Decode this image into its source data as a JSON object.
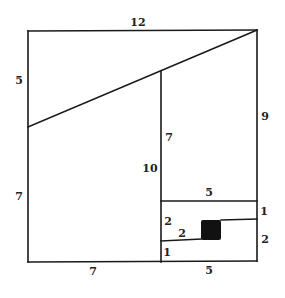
{
  "diagram": {
    "stroke_color": "#1a1a1a",
    "fill_color": "#111111",
    "labels": {
      "top": "12",
      "left_upper": "5",
      "left_lower": "7",
      "right_upper": "9",
      "middle_upper": "7",
      "middle_lower": "10",
      "inner_top": "5",
      "inner_left_upper": "2",
      "inner_step": "2",
      "inner_left_lower": "1",
      "right_small_upper": "1",
      "right_small_lower": "2",
      "bottom_left": "7",
      "bottom_right": "5"
    },
    "shaded_square": "black-square"
  }
}
